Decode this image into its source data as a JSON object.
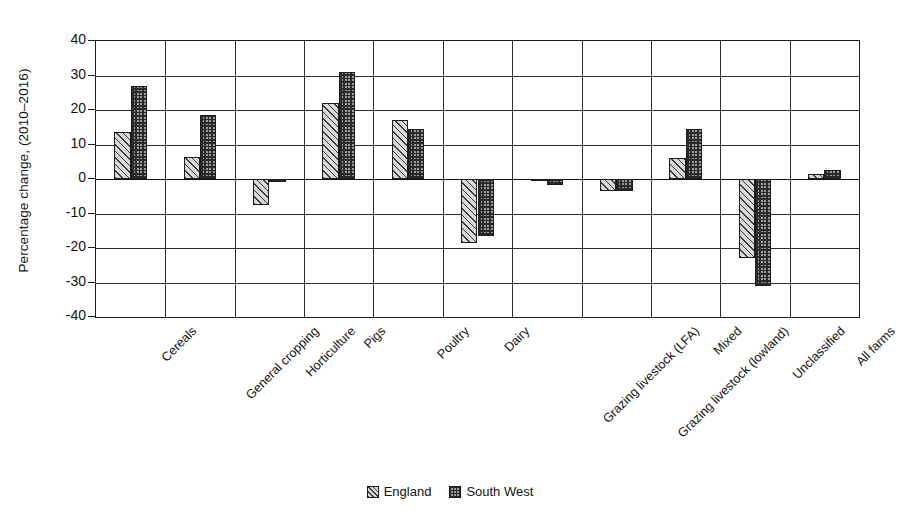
{
  "chart_data": {
    "type": "bar",
    "title": "",
    "xlabel": "",
    "ylabel": "Percentage change, (2010–2016)",
    "ylim": [
      -40,
      40
    ],
    "ytick_step": 10,
    "yticks": [
      40,
      30,
      20,
      10,
      0,
      -10,
      -20,
      -30,
      -40
    ],
    "ytick_labels": [
      "40",
      "30",
      "20",
      "10",
      "0",
      "-10",
      "-20",
      "-30",
      "-40"
    ],
    "grid": true,
    "grid_axes": "both",
    "legend_position": "bottom-center",
    "categories": [
      "Cereals",
      "General cropping",
      "Horticulture",
      "Pigs",
      "Poultry",
      "Dairy",
      "Grazing livestock (LFA)",
      "Grazing livestock (lowland)",
      "Mixed",
      "Unclassified",
      "All farms"
    ],
    "series": [
      {
        "name": "England",
        "pattern": "diagonal-hatch",
        "values": [
          13.5,
          6.3,
          -7.5,
          22.0,
          17.0,
          -18.5,
          -0.4,
          -3.5,
          6.0,
          -23.0,
          1.5
        ]
      },
      {
        "name": "South West",
        "pattern": "checkerboard-hatch",
        "values": [
          27.0,
          18.5,
          -1.0,
          31.0,
          14.5,
          -16.5,
          -1.8,
          -3.6,
          14.5,
          -31.0,
          2.5
        ]
      }
    ]
  },
  "legend": {
    "items": [
      {
        "label": "England"
      },
      {
        "label": "South West"
      }
    ]
  },
  "colors": {
    "axis": "#1a1a1a",
    "grid": "#2b2b2b",
    "text": "#131313",
    "series_england_fill": "#d8d8d8",
    "series_southwest_fill": "#9c9c9c",
    "background": "#ffffff"
  }
}
